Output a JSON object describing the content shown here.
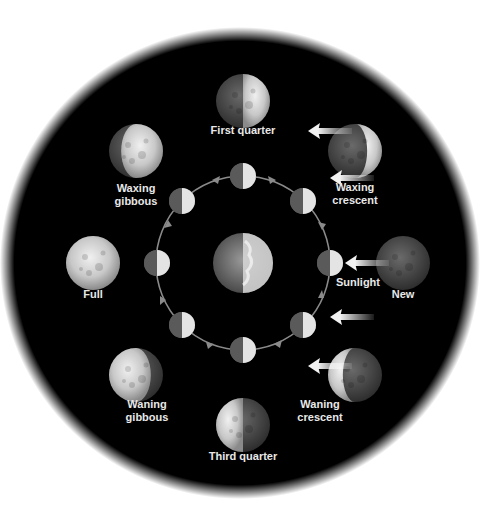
{
  "diagram": {
    "colors": {
      "space": "#000000",
      "background": "#ffffff",
      "label": "#e8e8e8",
      "orbit": "#8a8a8a",
      "lit": "#e6e6e6",
      "dark": "#4a4a4a",
      "arrow": "#f2f2f2"
    },
    "center_body": {
      "name": "Earth",
      "icon": "earth-icon"
    },
    "sunlight_label": "Sunlight",
    "orbit_direction": "counterclockwise",
    "phases": [
      {
        "id": "first-quarter",
        "label_line1": "First quarter",
        "label_line2": ""
      },
      {
        "id": "waxing-crescent",
        "label_line1": "Waxing",
        "label_line2": "crescent"
      },
      {
        "id": "new",
        "label_line1": "New",
        "label_line2": ""
      },
      {
        "id": "waning-crescent",
        "label_line1": "Waning",
        "label_line2": "crescent"
      },
      {
        "id": "third-quarter",
        "label_line1": "Third quarter",
        "label_line2": ""
      },
      {
        "id": "waning-gibbous",
        "label_line1": "Waning",
        "label_line2": "gibbous"
      },
      {
        "id": "full",
        "label_line1": "Full",
        "label_line2": ""
      },
      {
        "id": "waxing-gibbous",
        "label_line1": "Waxing",
        "label_line2": "gibbous"
      }
    ]
  }
}
